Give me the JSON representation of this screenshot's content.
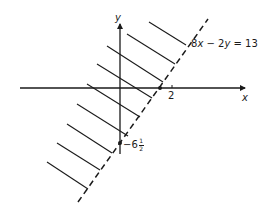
{
  "diagram": {
    "type": "inequality-region",
    "colors": {
      "ink": "#1a1a1a",
      "background": "#ffffff"
    },
    "axes": {
      "x_label": "x",
      "y_label": "y"
    },
    "boundary_line": {
      "equation_parts": [
        "8",
        "x",
        " − 2",
        "y",
        " = 13"
      ],
      "style": "dashed"
    },
    "x_intercept_label": "2",
    "y_intercept_label": {
      "sign": "−6",
      "numerator": "1",
      "denominator": "2"
    },
    "shading": "hatched lines on the left/upper side of boundary (excluded region)"
  }
}
